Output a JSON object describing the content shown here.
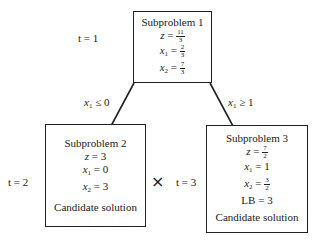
{
  "nodes": [
    {
      "id": "subproblem-1",
      "title": "Subproblem 1",
      "iteration_label": "t = 1",
      "values": [
        {
          "var": "z",
          "sub": "",
          "num": "11",
          "den": "3"
        },
        {
          "var": "x",
          "sub": "1",
          "num": "2",
          "den": "3"
        },
        {
          "var": "x",
          "sub": "2",
          "num": "7",
          "den": "3"
        }
      ]
    },
    {
      "id": "subproblem-2",
      "title": "Subproblem 2",
      "iteration_label": "t = 2",
      "values": [
        {
          "var": "z",
          "sub": "",
          "value": "3"
        },
        {
          "var": "x",
          "sub": "1",
          "value": "0"
        },
        {
          "var": "x",
          "sub": "2",
          "value": "3"
        }
      ],
      "note": "Candidate solution",
      "marker": "×"
    },
    {
      "id": "subproblem-3",
      "title": "Subproblem 3",
      "iteration_label": "t = 3",
      "values": [
        {
          "var": "z",
          "sub": "",
          "num": "7",
          "den": "2"
        },
        {
          "var": "x",
          "sub": "1",
          "value": "1"
        },
        {
          "var": "x",
          "sub": "2",
          "num": "3",
          "den": "2"
        },
        {
          "var": "LB",
          "sub": "",
          "value": "3"
        }
      ],
      "note": "Candidate solution"
    }
  ],
  "edges": [
    {
      "from": "subproblem-1",
      "to": "subproblem-2",
      "label_var": "x",
      "label_sub": "1",
      "label_rel": "≤ 0"
    },
    {
      "from": "subproblem-1",
      "to": "subproblem-3",
      "label_var": "x",
      "label_sub": "1",
      "label_rel": "≥ 1"
    }
  ],
  "eq": "="
}
